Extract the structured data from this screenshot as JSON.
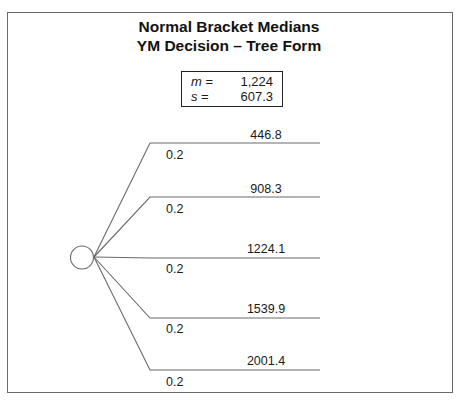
{
  "title": {
    "line1": "Normal Bracket Medians",
    "line2": "YM Decision – Tree Form"
  },
  "stats": {
    "mean": {
      "symbol": "m",
      "eq": " =",
      "value": "1,224"
    },
    "sd": {
      "symbol": "s",
      "eq": " =",
      "value": "607.3"
    }
  },
  "tree": {
    "node": {
      "type": "chance",
      "icon": "chance-node-circle"
    },
    "branches": [
      {
        "value": "446.8",
        "probability": "0.2"
      },
      {
        "value": "908.3",
        "probability": "0.2"
      },
      {
        "value": "1224.1",
        "probability": "0.2"
      },
      {
        "value": "1539.9",
        "probability": "0.2"
      },
      {
        "value": "2001.4",
        "probability": "0.2"
      }
    ]
  },
  "colors": {
    "line": "#6a6a6a",
    "text": "#1a1a1a"
  }
}
